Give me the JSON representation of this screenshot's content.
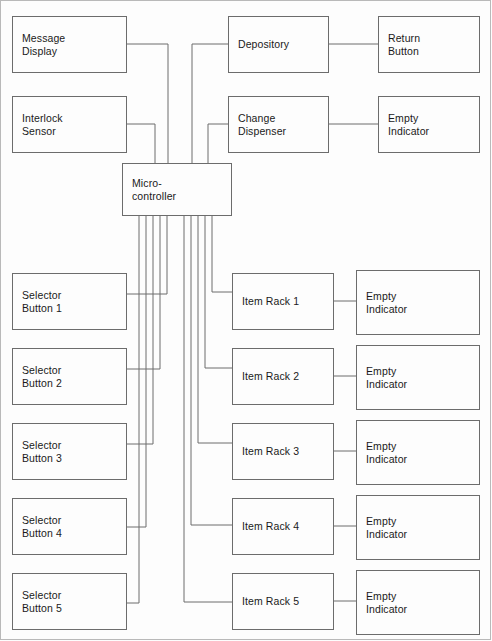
{
  "diagram": {
    "type": "block-diagram",
    "line_color": "#6c6c6c",
    "text_color": "#1a1a1a",
    "background": "#fdfdfd",
    "blocks": [
      {
        "id": "message-display",
        "label": "Message\nDisplay",
        "x": 12,
        "y": 16,
        "w": 115,
        "h": 57
      },
      {
        "id": "interlock-sensor",
        "label": "Interlock\nSensor",
        "x": 12,
        "y": 96,
        "w": 115,
        "h": 57
      },
      {
        "id": "microcontroller",
        "label": "Micro-\ncontroller",
        "x": 122,
        "y": 163,
        "w": 110,
        "h": 53
      },
      {
        "id": "depository",
        "label": "Depository",
        "x": 228,
        "y": 16,
        "w": 101,
        "h": 57
      },
      {
        "id": "return-button",
        "label": "Return\nButton",
        "x": 378,
        "y": 16,
        "w": 102,
        "h": 57
      },
      {
        "id": "change-dispenser",
        "label": "Change\nDispenser",
        "x": 228,
        "y": 96,
        "w": 101,
        "h": 57
      },
      {
        "id": "empty-indicator-0",
        "label": "Empty\nIndicator",
        "x": 378,
        "y": 96,
        "w": 102,
        "h": 57
      },
      {
        "id": "selector-button-1",
        "label": "Selector\nButton 1",
        "x": 12,
        "y": 273,
        "w": 115,
        "h": 57
      },
      {
        "id": "selector-button-2",
        "label": "Selector\nButton 2",
        "x": 12,
        "y": 348,
        "w": 115,
        "h": 57
      },
      {
        "id": "selector-button-3",
        "label": "Selector\nButton 3",
        "x": 12,
        "y": 423,
        "w": 115,
        "h": 57
      },
      {
        "id": "selector-button-4",
        "label": "Selector\nButton 4",
        "x": 12,
        "y": 498,
        "w": 115,
        "h": 57
      },
      {
        "id": "selector-button-5",
        "label": "Selector\nButton 5",
        "x": 12,
        "y": 573,
        "w": 115,
        "h": 57
      },
      {
        "id": "item-rack-1",
        "label": "Item Rack 1",
        "x": 232,
        "y": 273,
        "w": 102,
        "h": 57
      },
      {
        "id": "item-rack-2",
        "label": "Item Rack 2",
        "x": 232,
        "y": 348,
        "w": 102,
        "h": 57
      },
      {
        "id": "item-rack-3",
        "label": "Item Rack 3",
        "x": 232,
        "y": 423,
        "w": 102,
        "h": 57
      },
      {
        "id": "item-rack-4",
        "label": "Item Rack 4",
        "x": 232,
        "y": 498,
        "w": 102,
        "h": 57
      },
      {
        "id": "item-rack-5",
        "label": "Item Rack 5",
        "x": 232,
        "y": 573,
        "w": 102,
        "h": 57
      },
      {
        "id": "empty-indicator-1",
        "label": "Empty\nIndicator",
        "x": 356,
        "y": 270,
        "w": 124,
        "h": 65
      },
      {
        "id": "empty-indicator-2",
        "label": "Empty\nIndicator",
        "x": 356,
        "y": 345,
        "w": 124,
        "h": 65
      },
      {
        "id": "empty-indicator-3",
        "label": "Empty\nIndicator",
        "x": 356,
        "y": 420,
        "w": 124,
        "h": 65
      },
      {
        "id": "empty-indicator-4",
        "label": "Empty\nIndicator",
        "x": 356,
        "y": 495,
        "w": 124,
        "h": 65
      },
      {
        "id": "empty-indicator-5",
        "label": "Empty\nIndicator",
        "x": 356,
        "y": 570,
        "w": 124,
        "h": 65
      }
    ],
    "connections": [
      {
        "from": "message-display",
        "to": "microcontroller",
        "path": "M127,44 H168 V163"
      },
      {
        "from": "interlock-sensor",
        "to": "microcontroller",
        "path": "M127,124 H155 V163"
      },
      {
        "from": "depository",
        "to": "microcontroller",
        "path": "M228,44 H192 V163"
      },
      {
        "from": "change-dispenser",
        "to": "microcontroller",
        "path": "M228,124 H208 V163"
      },
      {
        "from": "depository",
        "to": "return-button",
        "path": "M329,44 H378"
      },
      {
        "from": "change-dispenser",
        "to": "empty-indicator-0",
        "path": "M329,124 H378"
      },
      {
        "from": "microcontroller",
        "to": "selector-button-1",
        "path": "M167,216 V294 H127"
      },
      {
        "from": "microcontroller",
        "to": "selector-button-2",
        "path": "M160,216 V369 H127"
      },
      {
        "from": "microcontroller",
        "to": "selector-button-3",
        "path": "M153,216 V444 H127"
      },
      {
        "from": "microcontroller",
        "to": "selector-button-4",
        "path": "M146,216 V527 H127"
      },
      {
        "from": "microcontroller",
        "to": "selector-button-5",
        "path": "M139,216 V603 H127"
      },
      {
        "from": "microcontroller",
        "to": "item-rack-1",
        "path": "M212,216 V292 H232"
      },
      {
        "from": "microcontroller",
        "to": "item-rack-2",
        "path": "M205,216 V368 H232"
      },
      {
        "from": "microcontroller",
        "to": "item-rack-3",
        "path": "M198,216 V443 H232"
      },
      {
        "from": "microcontroller",
        "to": "item-rack-4",
        "path": "M191,216 V525 H232"
      },
      {
        "from": "microcontroller",
        "to": "item-rack-5",
        "path": "M184,216 V602 H232"
      },
      {
        "from": "item-rack-1",
        "to": "empty-indicator-1",
        "path": "M334,301 H356"
      },
      {
        "from": "item-rack-2",
        "to": "empty-indicator-2",
        "path": "M334,376 H356"
      },
      {
        "from": "item-rack-3",
        "to": "empty-indicator-3",
        "path": "M334,451 H356"
      },
      {
        "from": "item-rack-4",
        "to": "empty-indicator-4",
        "path": "M334,526 H356"
      },
      {
        "from": "item-rack-5",
        "to": "empty-indicator-5",
        "path": "M334,601 H356"
      }
    ]
  }
}
